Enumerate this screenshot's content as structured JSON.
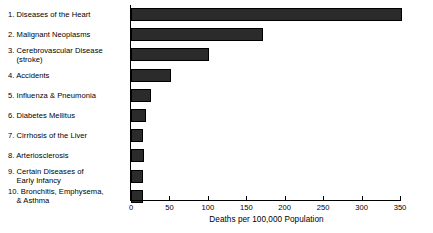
{
  "chart_data": {
    "type": "bar",
    "orientation": "horizontal",
    "title": "",
    "xlabel": "Deaths per 100,000 Population",
    "ylabel": "",
    "xlim": [
      0,
      350
    ],
    "xticks": [
      0,
      50,
      100,
      150,
      200,
      250,
      300,
      350
    ],
    "xtick_labels": [
      "0",
      "50",
      "100",
      "150",
      "200",
      "250",
      "300",
      "350"
    ],
    "grid": false,
    "legend": false,
    "bar_color": "#2b2b2b",
    "categories": [
      "1. Diseases of the Heart",
      "2. Malignant Neoplasms",
      "3. Cerebrovascular Disease\n(stroke)",
      "4. Accidents",
      "5. Influenza & Pneumonia",
      "6. Diabetes Mellitus",
      "7. Cirrhosis of the Liver",
      "8. Arteriosclerosis",
      "9. Certain Diseases of\nEarly Infancy",
      "10. Bronchitis, Emphysema,\n& Asthma"
    ],
    "values": [
      352,
      172,
      101,
      52,
      26,
      19,
      16,
      17,
      15,
      15
    ]
  }
}
